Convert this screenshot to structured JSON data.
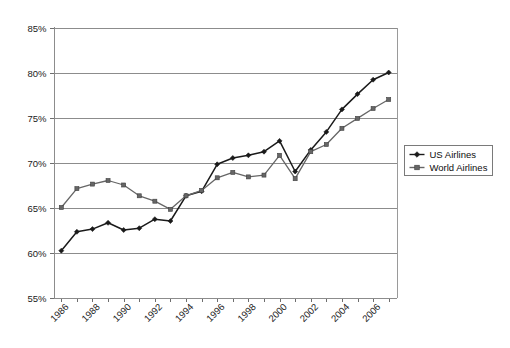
{
  "chart_data": {
    "type": "line",
    "title": "",
    "xlabel": "",
    "ylabel": "",
    "x": [
      1986,
      1987,
      1988,
      1989,
      1990,
      1991,
      1992,
      1993,
      1994,
      1995,
      1996,
      1997,
      1998,
      1999,
      2000,
      2001,
      2002,
      2003,
      2004,
      2005,
      2006,
      2007
    ],
    "xlim": [
      1985.5,
      2007.5
    ],
    "ylim": [
      55,
      85
    ],
    "y_ticks": [
      55,
      60,
      65,
      70,
      75,
      80,
      85
    ],
    "y_tick_labels": [
      "55%",
      "60%",
      "65%",
      "70%",
      "75%",
      "80%",
      "85%"
    ],
    "x_tick_labels": [
      "1986",
      "1988",
      "1990",
      "1992",
      "1994",
      "1996",
      "1998",
      "2000",
      "2002",
      "2004",
      "2006"
    ],
    "x_tick_label_years": [
      1986,
      1988,
      1990,
      1992,
      1994,
      1996,
      1998,
      2000,
      2002,
      2004,
      2006
    ],
    "grid": "horizontal",
    "legend_position": "right-outside",
    "series": [
      {
        "name": "US Airlines",
        "marker": "diamond",
        "color": "#1a1a1a",
        "values": [
          60.2,
          62.3,
          62.6,
          63.3,
          62.5,
          62.7,
          63.7,
          63.5,
          66.3,
          66.8,
          69.8,
          70.5,
          70.8,
          71.2,
          72.4,
          69.0,
          71.4,
          73.4,
          75.9,
          77.6,
          79.2,
          80.0
        ]
      },
      {
        "name": "World Airlines",
        "marker": "square",
        "color": "#666666",
        "values": [
          65.0,
          67.1,
          67.6,
          68.0,
          67.5,
          66.3,
          65.7,
          64.8,
          66.3,
          66.9,
          68.3,
          68.9,
          68.4,
          68.6,
          70.8,
          68.2,
          71.2,
          72.0,
          73.8,
          74.9,
          76.0,
          77.0
        ]
      }
    ]
  },
  "legend": {
    "entries": [
      {
        "label": "US Airlines",
        "marker": "diamond"
      },
      {
        "label": "World Airlines",
        "marker": "square"
      }
    ]
  }
}
